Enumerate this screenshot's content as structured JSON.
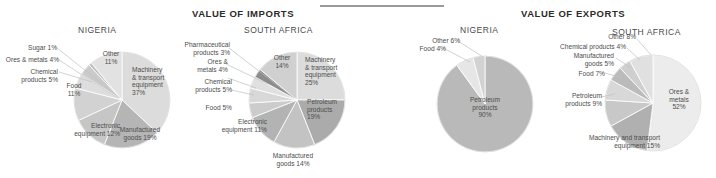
{
  "page": {
    "background": "#ffffff",
    "divider_color": "#9a9a9a"
  },
  "sections": {
    "imports_title": "VALUE OF IMPORTS",
    "exports_title": "VALUE OF EXPORTS"
  },
  "country_titles": {
    "nigeria_imports": "NIGERIA",
    "south_africa_imports": "SOUTH AFRICA",
    "nigeria_exports": "NIGERIA",
    "south_africa_exports": "SOUTH AFRICA"
  },
  "palette": {
    "lightest": "#e8e8e8",
    "light": "#dcdcdc",
    "mid_light": "#cfcfcf",
    "mid": "#bdbdbd",
    "mid_dark": "#ababab",
    "dark": "#9a9a9a",
    "darker": "#8c8c8c",
    "outline": "#d5d5d5"
  },
  "chart_data": [
    {
      "type": "pie",
      "id": "nigeria-imports",
      "title": "NIGERIA",
      "group": "VALUE OF IMPORTS",
      "center": [
        122,
        100
      ],
      "radius": 48,
      "start_angle_deg": -90,
      "categories": [
        "Machinery & transport equipment",
        "Manufactured goods",
        "Electronic equipment",
        "Food",
        "Chemical products",
        "Ores & metals",
        "Sugar",
        "Other"
      ],
      "values": [
        37,
        19,
        12,
        11,
        5,
        4,
        1,
        11
      ],
      "labels": [
        "Machinery\n& transport\nequipment\n37%",
        "Manufactured\ngoods 19%",
        "Electronic\nequipment 12%",
        "Food\n11%",
        "Chemical\nproducts 5%",
        "Ores & metals 4%",
        "Sugar 1%",
        "Other\n11%"
      ],
      "colors": [
        "#dcdcdc",
        "#b5b5b5",
        "#c6c6c6",
        "#d2d2d2",
        "#dddddd",
        "#cacaca",
        "#bdbdbd",
        "#e2e2e2"
      ]
    },
    {
      "type": "pie",
      "id": "south-africa-imports",
      "title": "SOUTH AFRICA",
      "group": "VALUE OF IMPORTS",
      "center": [
        297,
        100
      ],
      "radius": 48,
      "start_angle_deg": -90,
      "categories": [
        "Machinery & transport equipment",
        "Petroleum products",
        "Manufactured goods",
        "Electronic equipment",
        "Food",
        "Chemical products",
        "Ores & metals",
        "Pharmaceutical products",
        "Other"
      ],
      "values": [
        25,
        19,
        14,
        11,
        5,
        5,
        4,
        3,
        14
      ],
      "labels": [
        "Machinery\n& transport\nequipment\n25%",
        "Petroleum\nproducts\n19%",
        "Manufactured\ngoods 14%",
        "Electronic\nequipment 11%",
        "Food 5%",
        "Chemical\nproducts 5%",
        "Ores &\nmetals 4%",
        "Pharmaceutical\nproducts 3%",
        "Other\n14%"
      ],
      "colors": [
        "#dcdcdc",
        "#ababab",
        "#c3c3c3",
        "#b3b3b3",
        "#cccccc",
        "#d8d8d8",
        "#e0e0e0",
        "#8c8c8c",
        "#d0d0d0"
      ]
    },
    {
      "type": "pie",
      "id": "nigeria-exports",
      "title": "NIGERIA",
      "group": "VALUE OF EXPORTS",
      "center": [
        485,
        104
      ],
      "radius": 48,
      "start_angle_deg": -90,
      "categories": [
        "Petroleum products",
        "Other",
        "Food"
      ],
      "values": [
        90,
        6,
        4
      ],
      "labels": [
        "Petroleum\nproducts\n90%",
        "Other 6%",
        "Food 4%"
      ],
      "colors": [
        "#b9b9b9",
        "#e6e6e6",
        "#d2d2d2"
      ]
    },
    {
      "type": "pie",
      "id": "south-africa-exports",
      "title": "SOUTH AFRICA",
      "group": "VALUE OF EXPORTS",
      "center": [
        653,
        103
      ],
      "radius": 48,
      "start_angle_deg": -90,
      "categories": [
        "Ores & metals",
        "Machinery and transport equipment",
        "Petroleum products",
        "Food",
        "Manufactured goods",
        "Chemical products",
        "Other"
      ],
      "values": [
        52,
        15,
        9,
        7,
        5,
        4,
        8
      ],
      "labels": [
        "Ores &\nmetals\n52%",
        "Machinery and transport\nequipment 15%",
        "Petroleum\nproducts 9%",
        "Food 7%",
        "Manufactured\ngoods 5%",
        "Chemical products 4%",
        "Other 8%"
      ],
      "colors": [
        "#ececec",
        "#b0b0b0",
        "#c8c8c8",
        "#d8d8d8",
        "#bbbbbb",
        "#cfcfcf",
        "#e0e0e0"
      ]
    }
  ],
  "labels": {
    "ni_imp": {
      "machinery": "Machinery\n& transport\nequipment\n37%",
      "manufactured": "Manufactured\ngoods 19%",
      "electronic": "Electronic\nequipment 12%",
      "food": "Food\n11%",
      "chemical": "Chemical\nproducts 5%",
      "ores": "Ores & metals 4%",
      "sugar": "Sugar 1%",
      "other": "Other\n11%"
    },
    "sa_imp": {
      "machinery": "Machinery\n& transport\nequipment\n25%",
      "petroleum": "Petroleum\nproducts\n19%",
      "manufactured": "Manufactured\ngoods 14%",
      "electronic": "Electronic\nequipment 11%",
      "food": "Food 5%",
      "chemical": "Chemical\nproducts 5%",
      "ores": "Ores &\nmetals 4%",
      "pharma": "Pharmaceutical\nproducts 3%",
      "other": "Other\n14%"
    },
    "ni_exp": {
      "petroleum": "Petroleum\nproducts\n90%",
      "other": "Other 6%",
      "food": "Food 4%"
    },
    "sa_exp": {
      "ores": "Ores &\nmetals\n52%",
      "machinery": "Machinery and transport\nequipment 15%",
      "petroleum": "Petroleum\nproducts 9%",
      "food": "Food 7%",
      "manufactured": "Manufactured\ngoods 5%",
      "chemical": "Chemical products 4%",
      "other": "Other 8%"
    }
  }
}
